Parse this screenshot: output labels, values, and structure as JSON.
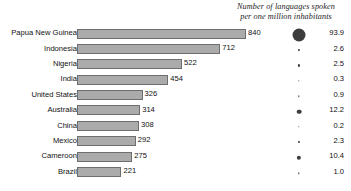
{
  "chart_data": {
    "type": "bar",
    "title": "",
    "xlabel": "",
    "ylabel": "",
    "orientation": "horizontal",
    "grid": false,
    "legend": "none",
    "xlim": [
      0,
      840
    ],
    "categories": [
      "Papua New Guinea",
      "Indonesia",
      "Nigeria",
      "India",
      "United States",
      "Australia",
      "China",
      "Mexico",
      "Cameroon",
      "Brazil"
    ],
    "series": [
      {
        "name": "Number of languages",
        "values": [
          840,
          712,
          522,
          454,
          326,
          314,
          308,
          292,
          275,
          221
        ]
      },
      {
        "name": "Number of languages spoken per one million inhabitants",
        "values": [
          93.9,
          2.6,
          2.5,
          0.3,
          0.9,
          12.2,
          0.2,
          2.3,
          10.4,
          1.0
        ]
      }
    ],
    "value_labels": [
      "840",
      "712",
      "522",
      "454",
      "326",
      "314",
      "308",
      "292",
      "275",
      "221"
    ],
    "ratio_labels": [
      "93.9",
      "2.6",
      "2.5",
      "0.3",
      "0.9",
      "12.2",
      "0.2",
      "2.3",
      "10.4",
      "1.0"
    ],
    "bar_color": "#ababab",
    "bar_border_color": "#6e6e6e",
    "dot_color": "#3d3d3d"
  },
  "header": {
    "line1": "Number of languages spoken",
    "line2": "per one million inhabitants"
  },
  "rows": [
    {
      "country": "Papua New Guinea",
      "languages": "840",
      "per_million": "93.9"
    },
    {
      "country": "Indonesia",
      "languages": "712",
      "per_million": "2.6"
    },
    {
      "country": "Nigeria",
      "languages": "522",
      "per_million": "2.5"
    },
    {
      "country": "India",
      "languages": "454",
      "per_million": "0.3"
    },
    {
      "country": "United States",
      "languages": "326",
      "per_million": "0.9"
    },
    {
      "country": "Australia",
      "languages": "314",
      "per_million": "12.2"
    },
    {
      "country": "China",
      "languages": "308",
      "per_million": "0.2"
    },
    {
      "country": "Mexico",
      "languages": "292",
      "per_million": "2.3"
    },
    {
      "country": "Cameroon",
      "languages": "275",
      "per_million": "10.4"
    },
    {
      "country": "Brazil",
      "languages": "221",
      "per_million": "1.0"
    }
  ]
}
